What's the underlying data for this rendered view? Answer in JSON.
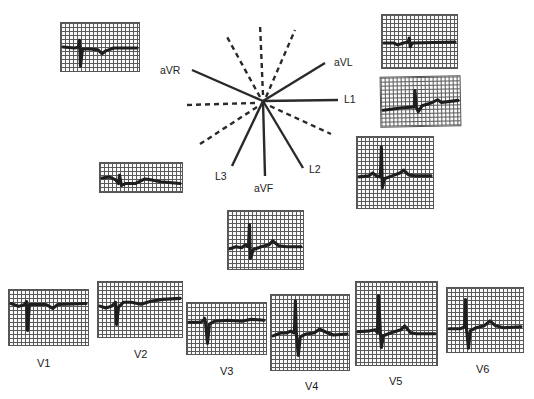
{
  "figure": {
    "type": "12-lead electrocardiogram with hexaxial reference system",
    "hexaxial": {
      "labels": {
        "aVR": "aVR",
        "aVL": "aVL",
        "L1": "L1",
        "L2": "L2",
        "L3": "L3",
        "aVF": "aVF"
      },
      "solid_axes_degrees": {
        "L1": 0,
        "L2": 60,
        "aVF": 90,
        "L3": 120,
        "aVR": -150,
        "aVL": -30
      },
      "dashed_axes_degrees": [
        -60,
        -90,
        -120,
        180,
        150,
        30
      ]
    },
    "limb_leads": [
      {
        "lead": "aVR",
        "label": "",
        "waveform": "inverted"
      },
      {
        "lead": "aVL",
        "label": "",
        "waveform": "low-voltage"
      },
      {
        "lead": "L1",
        "label": "",
        "waveform": "small-upright"
      },
      {
        "lead": "L2",
        "label": "",
        "waveform": "upright"
      },
      {
        "lead": "L3",
        "label": "",
        "waveform": "low-voltage"
      },
      {
        "lead": "aVF",
        "label": "",
        "waveform": "upright"
      }
    ],
    "precordial_leads": [
      {
        "lead": "V1",
        "label": "V1"
      },
      {
        "lead": "V2",
        "label": "V2"
      },
      {
        "lead": "V3",
        "label": "V3"
      },
      {
        "lead": "V4",
        "label": "V4"
      },
      {
        "lead": "V5",
        "label": "V5"
      },
      {
        "lead": "V6",
        "label": "V6"
      }
    ]
  }
}
